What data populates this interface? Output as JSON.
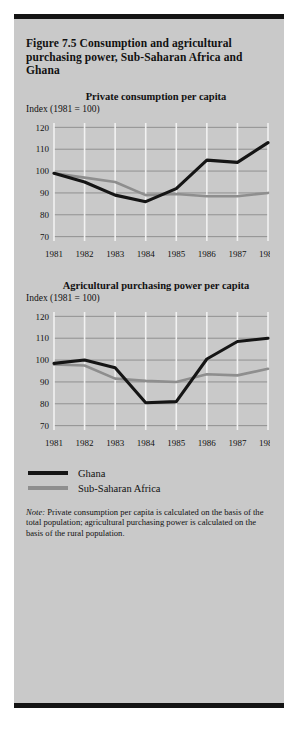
{
  "figure": {
    "title": "Figure 7.5  Consumption and agricultural purchasing power, Sub-Saharan Africa and Ghana",
    "note_prefix": "Note:",
    "note_text": " Private consumption per capita is calculated on the basis of the total population; agricultural purchasing power is calculated on the basis of the rural population.",
    "background_color": "#c9c9c9",
    "border_color": "#141414"
  },
  "legend": {
    "position": "bottom-left",
    "entries": [
      {
        "label": "Ghana",
        "color": "#151515"
      },
      {
        "label": "Sub-Saharan Africa",
        "color": "#8e8e8e"
      }
    ]
  },
  "chart_data": [
    {
      "type": "line",
      "title": "Private consumption per capita",
      "ylabel": "Index (1981 = 100)",
      "xlabel": "",
      "categories": [
        "1981",
        "1982",
        "1983",
        "1984",
        "1985",
        "1986",
        "1987",
        "1988"
      ],
      "yticks": [
        120,
        110,
        100,
        90,
        80,
        70
      ],
      "ylim": [
        68,
        122
      ],
      "grid": true,
      "series": [
        {
          "name": "Ghana",
          "color": "#151515",
          "values": [
            99,
            95,
            89,
            86,
            92,
            105,
            104,
            113
          ]
        },
        {
          "name": "Sub-Saharan Africa",
          "color": "#8e8e8e",
          "values": [
            99,
            97,
            95,
            89,
            89.5,
            88.5,
            88.5,
            90
          ]
        }
      ]
    },
    {
      "type": "line",
      "title": "Agricultural purchasing power per capita",
      "ylabel": "Index (1981 = 100)",
      "xlabel": "",
      "categories": [
        "1981",
        "1982",
        "1983",
        "1984",
        "1985",
        "1986",
        "1987",
        "1988"
      ],
      "yticks": [
        120,
        110,
        100,
        90,
        80,
        70
      ],
      "ylim": [
        68,
        122
      ],
      "grid": true,
      "series": [
        {
          "name": "Ghana",
          "color": "#151515",
          "values": [
            98.5,
            100,
            96.5,
            80.5,
            81,
            100.5,
            108.5,
            110
          ]
        },
        {
          "name": "Sub-Saharan Africa",
          "color": "#8e8e8e",
          "values": [
            98,
            97.5,
            91.5,
            90.5,
            90,
            93.5,
            93,
            96
          ]
        }
      ]
    }
  ]
}
